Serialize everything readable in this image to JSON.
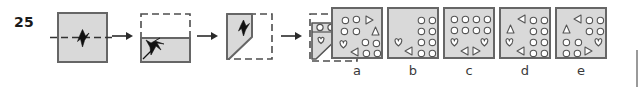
{
  "question": {
    "number": "25",
    "type": "paper-folding-hole-punch"
  },
  "sequence": {
    "arrow_glyph": "→",
    "steps": [
      {
        "name": "step-1-unfolded-square",
        "description": "square sheet with horizontal dashed fold line and punch mark at centre",
        "fold": "horizontal",
        "shape": "square"
      },
      {
        "name": "step-2-folded-in-half",
        "description": "bottom half solid, top half shown dashed after horizontal fold",
        "fold": "horizontal-complete",
        "shape": "rectangle"
      },
      {
        "name": "step-3-diagonal-fold",
        "description": "left portion folded along diagonal forming trapezoid, right side dashed",
        "fold": "diagonal",
        "shape": "trapezoid"
      },
      {
        "name": "step-4-punched",
        "description": "trapezoid with two circles punched in upper band and one heart below",
        "punches": [
          "circle",
          "circle",
          "heart"
        ],
        "shape": "trapezoid"
      }
    ]
  },
  "options": {
    "labels": [
      "a",
      "b",
      "c",
      "d",
      "e"
    ],
    "panels": [
      {
        "label": "a",
        "name": "option-a",
        "shapes": [
          {
            "kind": "circle",
            "x": 9,
            "y": 8
          },
          {
            "kind": "circle",
            "x": 20,
            "y": 7
          },
          {
            "kind": "tri-right",
            "x": 33,
            "y": 7
          },
          {
            "kind": "circle",
            "x": 8,
            "y": 19
          },
          {
            "kind": "circle",
            "x": 20,
            "y": 19
          },
          {
            "kind": "tri-up",
            "x": 39,
            "y": 18
          },
          {
            "kind": "heart",
            "x": 7,
            "y": 31
          },
          {
            "kind": "circle",
            "x": 29,
            "y": 30
          },
          {
            "kind": "circle",
            "x": 40,
            "y": 31
          },
          {
            "kind": "tri-left",
            "x": 18,
            "y": 39
          },
          {
            "kind": "circle",
            "x": 30,
            "y": 41
          },
          {
            "kind": "circle",
            "x": 41,
            "y": 41
          }
        ]
      },
      {
        "label": "b",
        "name": "option-b",
        "shapes": [
          {
            "kind": "circle",
            "x": 29,
            "y": 8
          },
          {
            "kind": "circle",
            "x": 40,
            "y": 8
          },
          {
            "kind": "circle",
            "x": 29,
            "y": 19
          },
          {
            "kind": "circle",
            "x": 40,
            "y": 19
          },
          {
            "kind": "heart",
            "x": 6,
            "y": 29
          },
          {
            "kind": "circle",
            "x": 29,
            "y": 30
          },
          {
            "kind": "circle",
            "x": 40,
            "y": 30
          },
          {
            "kind": "tri-left",
            "x": 16,
            "y": 38
          },
          {
            "kind": "circle",
            "x": 29,
            "y": 41
          },
          {
            "kind": "circle",
            "x": 40,
            "y": 41
          }
        ]
      },
      {
        "label": "c",
        "name": "option-c",
        "shapes": [
          {
            "kind": "circle",
            "x": 6,
            "y": 7
          },
          {
            "kind": "circle",
            "x": 17,
            "y": 7
          },
          {
            "kind": "circle",
            "x": 28,
            "y": 7
          },
          {
            "kind": "circle",
            "x": 39,
            "y": 7
          },
          {
            "kind": "circle",
            "x": 6,
            "y": 18
          },
          {
            "kind": "circle",
            "x": 17,
            "y": 18
          },
          {
            "kind": "circle",
            "x": 28,
            "y": 18
          },
          {
            "kind": "circle",
            "x": 39,
            "y": 18
          },
          {
            "kind": "heart",
            "x": 6,
            "y": 29
          },
          {
            "kind": "heart",
            "x": 36,
            "y": 29
          },
          {
            "kind": "tri-left",
            "x": 16,
            "y": 38
          },
          {
            "kind": "tri-right",
            "x": 28,
            "y": 38
          }
        ]
      },
      {
        "label": "d",
        "name": "option-d",
        "shapes": [
          {
            "kind": "tri-left",
            "x": 17,
            "y": 6
          },
          {
            "kind": "circle",
            "x": 29,
            "y": 8
          },
          {
            "kind": "circle",
            "x": 40,
            "y": 8
          },
          {
            "kind": "tri-up",
            "x": 6,
            "y": 16
          },
          {
            "kind": "circle",
            "x": 29,
            "y": 19
          },
          {
            "kind": "circle",
            "x": 40,
            "y": 19
          },
          {
            "kind": "heart",
            "x": 5,
            "y": 29
          },
          {
            "kind": "circle",
            "x": 29,
            "y": 30
          },
          {
            "kind": "circle",
            "x": 40,
            "y": 30
          },
          {
            "kind": "tri-left",
            "x": 16,
            "y": 38
          },
          {
            "kind": "circle",
            "x": 29,
            "y": 41
          },
          {
            "kind": "circle",
            "x": 40,
            "y": 41
          }
        ]
      },
      {
        "label": "e",
        "name": "option-e",
        "shapes": [
          {
            "kind": "tri-left",
            "x": 17,
            "y": 6
          },
          {
            "kind": "circle",
            "x": 29,
            "y": 8
          },
          {
            "kind": "circle",
            "x": 40,
            "y": 8
          },
          {
            "kind": "tri-up",
            "x": 6,
            "y": 16
          },
          {
            "kind": "circle",
            "x": 29,
            "y": 19
          },
          {
            "kind": "circle",
            "x": 40,
            "y": 19
          },
          {
            "kind": "circle",
            "x": 6,
            "y": 30
          },
          {
            "kind": "circle",
            "x": 18,
            "y": 30
          },
          {
            "kind": "heart",
            "x": 38,
            "y": 29
          },
          {
            "kind": "circle",
            "x": 6,
            "y": 41
          },
          {
            "kind": "circle",
            "x": 17,
            "y": 41
          },
          {
            "kind": "tri-right",
            "x": 28,
            "y": 38
          }
        ]
      }
    ]
  },
  "colors": {
    "paper_fill": "#d9d9d9",
    "paper_stroke": "#666666",
    "fold_dash": "#4d4d4d",
    "ink": "#1a1a1a",
    "label": "#3a3a3a",
    "hole_fill": "#ffffff",
    "hole_stroke": "#555555"
  }
}
